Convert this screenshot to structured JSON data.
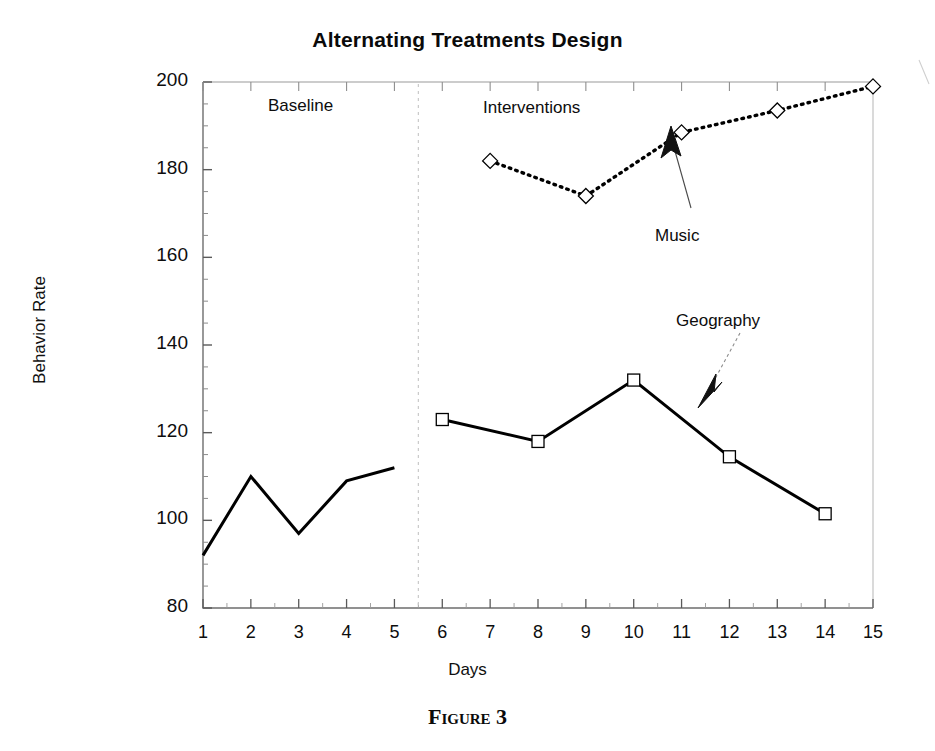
{
  "figure": {
    "caption": "Figure 3"
  },
  "chart_data": {
    "type": "line",
    "title": "Alternating Treatments Design",
    "xlabel": "Days",
    "ylabel": "Behavior Rate",
    "xlim": [
      1,
      15
    ],
    "ylim": [
      80,
      200
    ],
    "ytick_labels": [
      "80",
      "100",
      "120",
      "140",
      "160",
      "180",
      "200"
    ],
    "yticks": [
      80,
      100,
      120,
      140,
      160,
      180,
      200
    ],
    "xtick_labels": [
      "1",
      "2",
      "3",
      "4",
      "5",
      "6",
      "7",
      "8",
      "9",
      "10",
      "11",
      "12",
      "13",
      "14",
      "15"
    ],
    "xticks": [
      1,
      2,
      3,
      4,
      5,
      6,
      7,
      8,
      9,
      10,
      11,
      12,
      13,
      14,
      15
    ],
    "grid": false,
    "legend_position": "inline-annotations",
    "phase_divider_x": 5.5,
    "series": [
      {
        "name": "Baseline",
        "style": "solid",
        "marker": "none",
        "color": "#000000",
        "x": [
          1,
          2,
          3,
          4,
          5
        ],
        "values": [
          92,
          110,
          97,
          109,
          112
        ]
      },
      {
        "name": "Geography",
        "style": "solid",
        "marker": "square",
        "color": "#000000",
        "x": [
          6,
          8,
          10,
          12,
          14
        ],
        "values": [
          123,
          118,
          132,
          114.5,
          101.5
        ]
      },
      {
        "name": "Music",
        "style": "dotted",
        "marker": "diamond",
        "color": "#000000",
        "x": [
          7,
          9,
          11,
          13,
          15
        ],
        "values": [
          182,
          174,
          188.5,
          193.5,
          199
        ]
      }
    ],
    "annotations": [
      {
        "text": "Baseline",
        "x_px": 268,
        "y_px": 96
      },
      {
        "text": "Interventions",
        "x_px": 483,
        "y_px": 98
      },
      {
        "text": "Music",
        "x_px": 655,
        "y_px": 226
      },
      {
        "text": "Geography",
        "x_px": 676,
        "y_px": 311
      }
    ]
  }
}
